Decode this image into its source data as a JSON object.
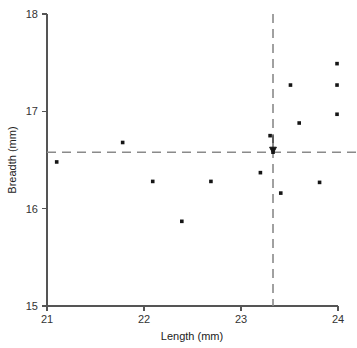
{
  "figure": {
    "background_color": "#ffffff",
    "point_color": "#151515",
    "axis_color": "#555555",
    "refline_color": "#8a8a8a"
  },
  "axes": {
    "x_title": "Length (mm)",
    "y_title": "Breadth (mm)",
    "x_ticks": [
      "21",
      "22",
      "23",
      "24"
    ],
    "y_ticks": [
      "18",
      "17",
      "16",
      "15"
    ]
  },
  "chart_data": {
    "type": "scatter",
    "title": "",
    "xlabel": "Length (mm)",
    "ylabel": "Breadth (mm)",
    "xlim": [
      21,
      24
    ],
    "ylim": [
      15,
      18
    ],
    "xticks": [
      21,
      22,
      23,
      24
    ],
    "yticks": [
      15,
      16,
      17,
      18
    ],
    "grid": false,
    "legend": null,
    "points": [
      {
        "x": 21.1,
        "y": 16.48
      },
      {
        "x": 21.78,
        "y": 16.68
      },
      {
        "x": 22.09,
        "y": 16.28
      },
      {
        "x": 22.39,
        "y": 15.87
      },
      {
        "x": 22.69,
        "y": 16.28
      },
      {
        "x": 23.2,
        "y": 16.37
      },
      {
        "x": 23.3,
        "y": 16.75
      },
      {
        "x": 23.33,
        "y": 16.58
      },
      {
        "x": 23.41,
        "y": 16.16
      },
      {
        "x": 23.51,
        "y": 17.27
      },
      {
        "x": 23.6,
        "y": 16.88
      },
      {
        "x": 23.81,
        "y": 16.27
      },
      {
        "x": 23.99,
        "y": 17.49
      },
      {
        "x": 23.99,
        "y": 17.27
      },
      {
        "x": 23.99,
        "y": 16.97
      }
    ],
    "reference_lines": [
      {
        "orientation": "vertical",
        "value": 23.33,
        "style": "dashed"
      },
      {
        "orientation": "horizontal",
        "value": 16.58,
        "style": "dashed"
      }
    ],
    "annotations": [
      {
        "type": "arrow",
        "x": 23.33,
        "y": 16.58,
        "direction": "down"
      }
    ]
  }
}
